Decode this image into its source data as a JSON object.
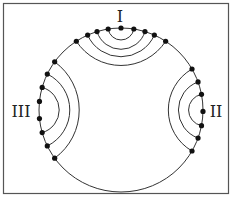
{
  "diagram": {
    "frame": {
      "x": 3,
      "y": 3,
      "width": 225,
      "height": 190,
      "stroke": "#555555"
    },
    "circle": {
      "cx": 121,
      "cy": 110,
      "r": 82,
      "stroke": "#333333"
    },
    "labels": {
      "I": "I",
      "II": "II",
      "III": "III"
    },
    "clusters": [
      {
        "name": "I",
        "center_angle_deg": -90,
        "arc_count": 4
      },
      {
        "name": "II",
        "center_angle_deg": 0,
        "arc_count": 3
      },
      {
        "name": "III",
        "center_angle_deg": 180,
        "arc_count": 3
      }
    ],
    "dot_color": "#111111"
  }
}
